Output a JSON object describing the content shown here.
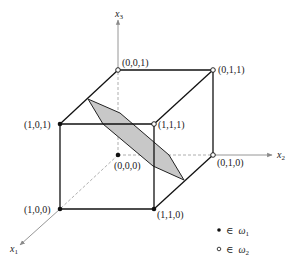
{
  "diagram": {
    "type": "3d-unit-cube-decision-plane",
    "colors": {
      "edge": "#111111",
      "hidden_edge": "#9a9a9a",
      "axis": "#8a8a8a",
      "plane_fill": "#c8c8c8",
      "plane_stroke": "#222222",
      "filled_point": "#111111",
      "open_point_fill": "#ffffff"
    },
    "axes": {
      "x1": {
        "label": "x",
        "sub": "1"
      },
      "x2": {
        "label": "x",
        "sub": "2"
      },
      "x3": {
        "label": "x",
        "sub": "3"
      }
    },
    "vertices": [
      {
        "id": "v001",
        "label": "(0,0,1)",
        "class": "omega2",
        "x": 118,
        "y": 70
      },
      {
        "id": "v011",
        "label": "(0,1,1)",
        "class": "omega2",
        "x": 213,
        "y": 70
      },
      {
        "id": "v101",
        "label": "(1,0,1)",
        "class": "omega1",
        "x": 60,
        "y": 124
      },
      {
        "id": "v111",
        "label": "(1,1,1)",
        "class": "omega2",
        "x": 154,
        "y": 124
      },
      {
        "id": "v000",
        "label": "(0,0,0)",
        "class": "omega1",
        "x": 118,
        "y": 155
      },
      {
        "id": "v010",
        "label": "(0,1,0)",
        "class": "omega2",
        "x": 213,
        "y": 155
      },
      {
        "id": "v100",
        "label": "(1,0,0)",
        "class": "omega1",
        "x": 60,
        "y": 209
      },
      {
        "id": "v110",
        "label": "(1,1,0)",
        "class": "omega1",
        "x": 154,
        "y": 209
      }
    ],
    "legend": [
      {
        "marker": "filled",
        "symbol": "∈",
        "label": "ω",
        "sub": "1"
      },
      {
        "marker": "open",
        "symbol": "∈",
        "label": "ω",
        "sub": "2"
      }
    ]
  }
}
